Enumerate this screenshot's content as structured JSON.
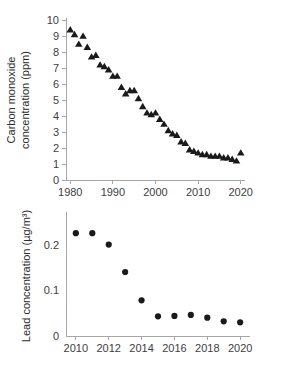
{
  "chart_data": [
    {
      "id": "carbon-monoxide",
      "type": "scatter",
      "title": "",
      "xlabel": "",
      "ylabel": "Carbon monoxide concentration (ppm)",
      "ylabel_line1": "Carbon monoxide",
      "ylabel_line2": "concentration (ppm)",
      "marker": "triangle",
      "marker_color": "#1a1a1a",
      "grid": false,
      "legend": "none",
      "xlim": [
        1979,
        2021
      ],
      "ylim": [
        0,
        10
      ],
      "xticks": [
        1980,
        1990,
        2000,
        2010,
        2020
      ],
      "xtick_labels": [
        "1980",
        "1990",
        "2000",
        "2010",
        "2020"
      ],
      "yticks": [
        0,
        1,
        2,
        3,
        4,
        5,
        6,
        7,
        8,
        9,
        10
      ],
      "ytick_labels": [
        "0",
        "1",
        "2",
        "3",
        "4",
        "5",
        "6",
        "7",
        "8",
        "9",
        "10"
      ],
      "x": [
        1980,
        1981,
        1982,
        1983,
        1984,
        1985,
        1986,
        1987,
        1988,
        1989,
        1990,
        1991,
        1992,
        1993,
        1994,
        1995,
        1996,
        1997,
        1998,
        1999,
        2000,
        2001,
        2002,
        2003,
        2004,
        2005,
        2006,
        2007,
        2008,
        2009,
        2010,
        2011,
        2012,
        2013,
        2014,
        2015,
        2016,
        2017,
        2018,
        2019,
        2020
      ],
      "values": [
        9.4,
        9.1,
        8.5,
        9.0,
        8.3,
        7.7,
        7.8,
        7.2,
        7.1,
        6.9,
        6.5,
        6.5,
        5.8,
        5.4,
        5.6,
        5.6,
        5.1,
        4.6,
        4.2,
        4.1,
        4.2,
        3.8,
        3.5,
        3.1,
        2.9,
        2.8,
        2.4,
        2.3,
        1.9,
        1.8,
        1.7,
        1.6,
        1.6,
        1.5,
        1.5,
        1.5,
        1.4,
        1.4,
        1.3,
        1.2,
        1.7
      ]
    },
    {
      "id": "lead",
      "type": "scatter",
      "title": "",
      "xlabel": "",
      "ylabel": "Lead concentration (µg/m³)",
      "marker": "circle",
      "marker_color": "#1a1a1a",
      "grid": false,
      "legend": "none",
      "xlim": [
        2009.4,
        2020.6
      ],
      "ylim": [
        0,
        0.245
      ],
      "xticks": [
        2010,
        2012,
        2014,
        2016,
        2018,
        2020
      ],
      "xtick_labels": [
        "2010",
        "2012",
        "2014",
        "2016",
        "2018",
        "2020"
      ],
      "yticks": [
        0,
        0.1,
        0.2
      ],
      "ytick_labels": [
        "0",
        "0.1",
        "0.2"
      ],
      "x": [
        2010,
        2011,
        2012,
        2013,
        2014,
        2015,
        2016,
        2017,
        2018,
        2019,
        2020
      ],
      "values": [
        0.225,
        0.225,
        0.2,
        0.14,
        0.078,
        0.043,
        0.044,
        0.046,
        0.04,
        0.032,
        0.03
      ]
    }
  ]
}
